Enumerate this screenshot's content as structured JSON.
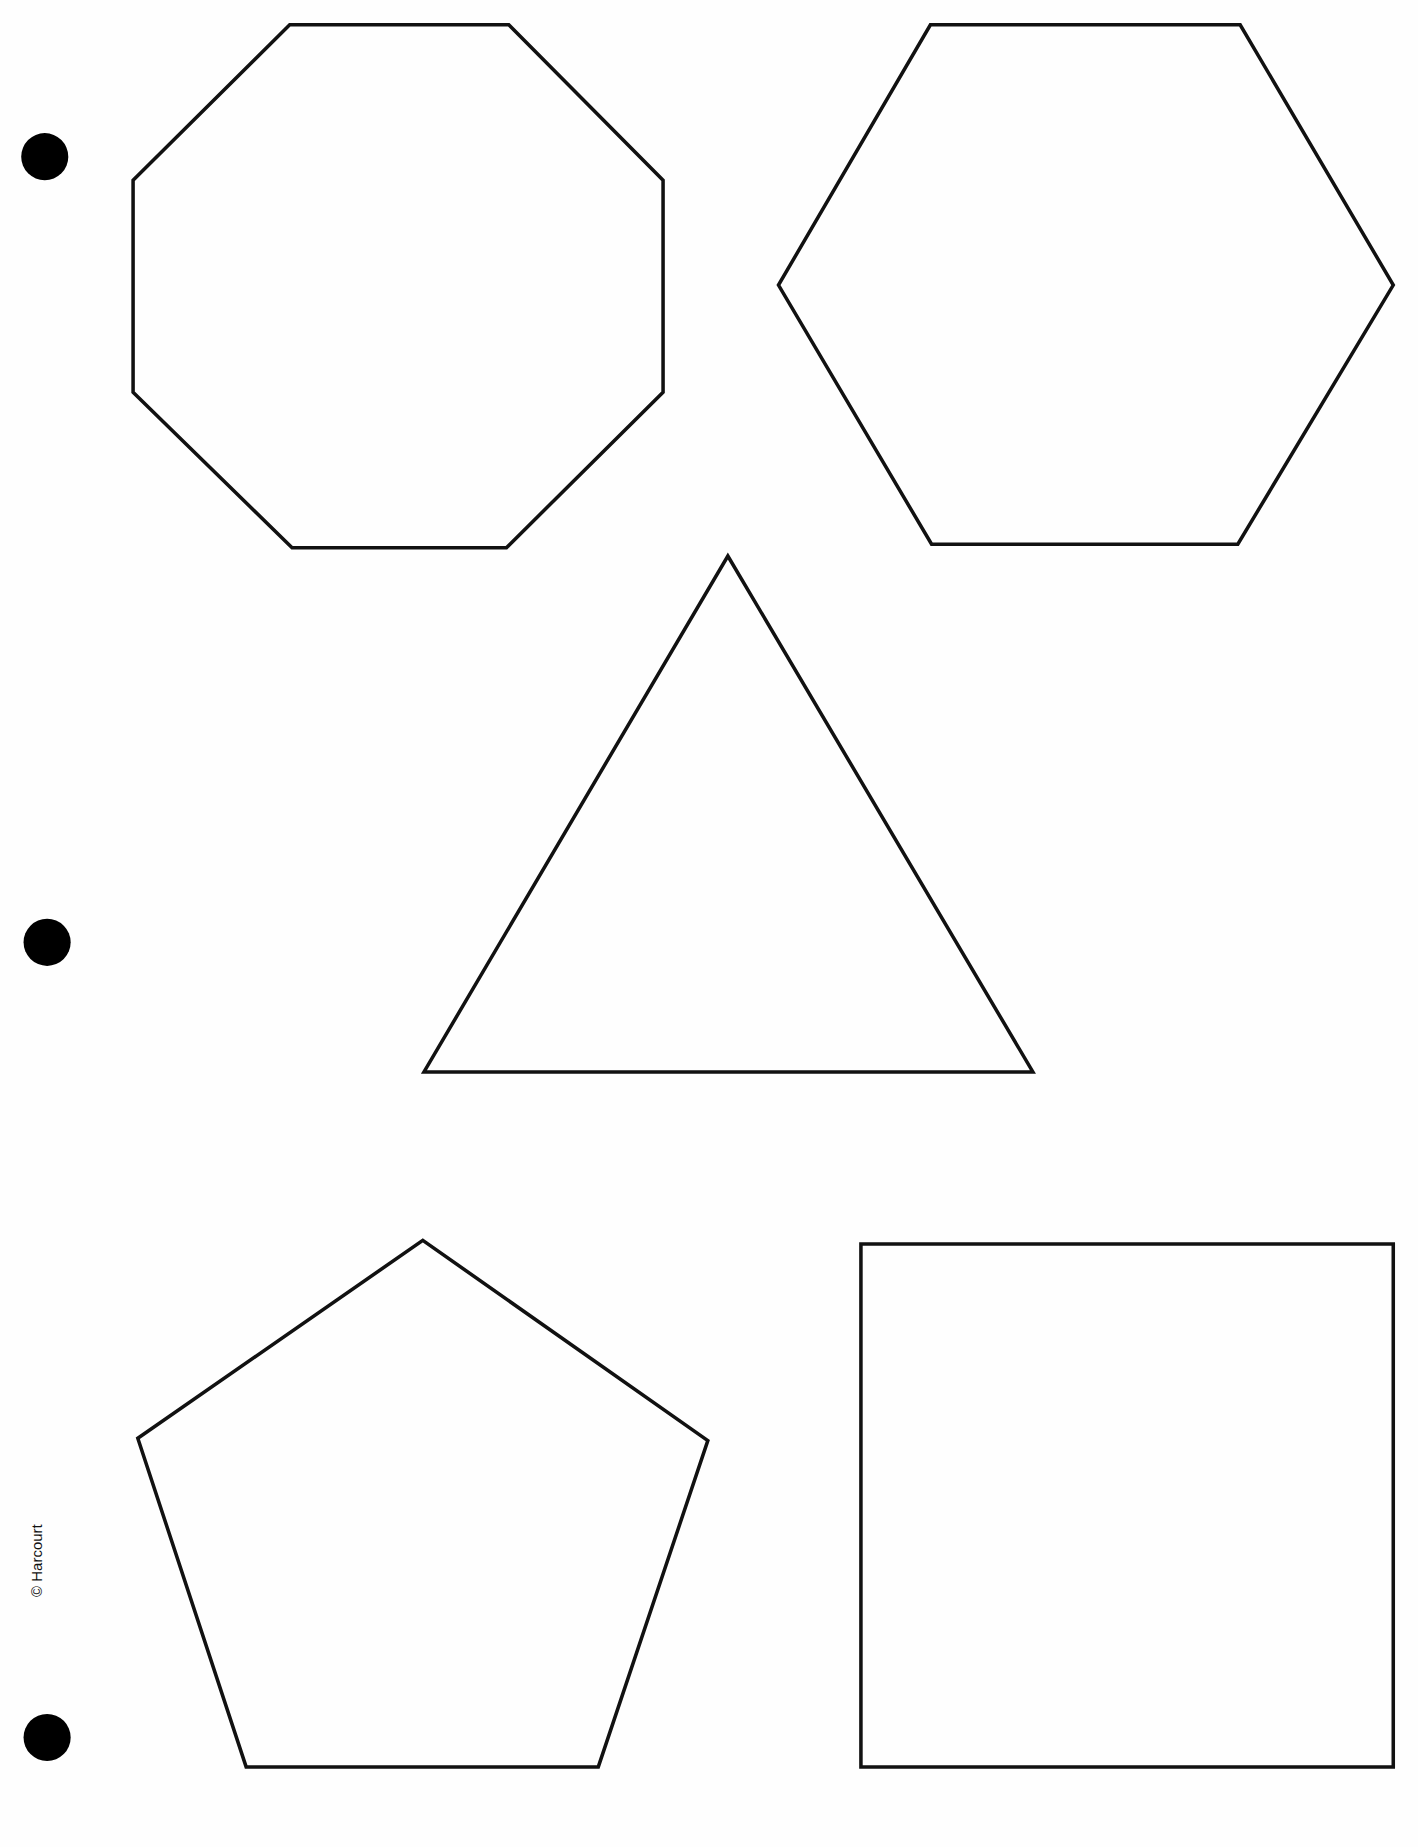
{
  "page": {
    "type": "worksheet",
    "background": "#fefefe",
    "stroke_color": "#111111"
  },
  "copyright": "© Harcourt",
  "binder_holes": [
    {
      "cx": 38,
      "cy": 133,
      "r": 20
    },
    {
      "cx": 40,
      "cy": 800,
      "r": 20
    },
    {
      "cx": 40,
      "cy": 1475,
      "r": 20
    }
  ],
  "shapes": [
    {
      "name": "octagon",
      "points": "246,21 432,21 563,153 563,333 430,465 248,465 113,333 113,153"
    },
    {
      "name": "hexagon",
      "points": "790,21 1053,21 1183,242 1051,462 791,462 661,242"
    },
    {
      "name": "triangle",
      "points": "618,472 877,910 360,910"
    },
    {
      "name": "pentagon",
      "points": "359,1053 601,1223 508,1500 209,1500 117,1221"
    },
    {
      "name": "square",
      "points": "731,1056 1183,1056 1183,1500 731,1500"
    }
  ]
}
